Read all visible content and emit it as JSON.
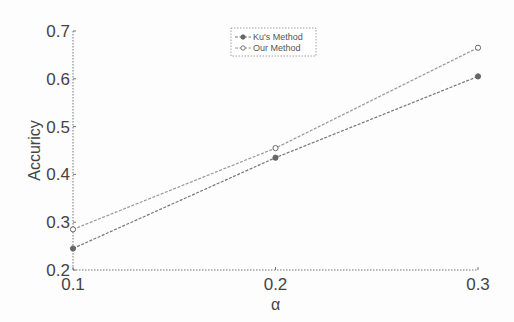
{
  "chart_data": {
    "type": "line",
    "title": "",
    "xlabel": "α",
    "ylabel": "Accuricy",
    "x": [
      0.1,
      0.2,
      0.3
    ],
    "xticks": [
      "0.1",
      "0.2",
      "0.3"
    ],
    "yticks": [
      "0.2",
      "0.3",
      "0.4",
      "0.5",
      "0.6",
      "0.7"
    ],
    "xlim": [
      0.1,
      0.3
    ],
    "ylim": [
      0.2,
      0.7
    ],
    "grid": false,
    "legend_position": "upper center",
    "series": [
      {
        "name": "Ku's Method",
        "values": [
          0.245,
          0.435,
          0.605
        ],
        "color": "#777777",
        "marker": "circle-filled"
      },
      {
        "name": "Our Method",
        "values": [
          0.285,
          0.455,
          0.665
        ],
        "color": "#999999",
        "marker": "circle-open"
      }
    ]
  }
}
